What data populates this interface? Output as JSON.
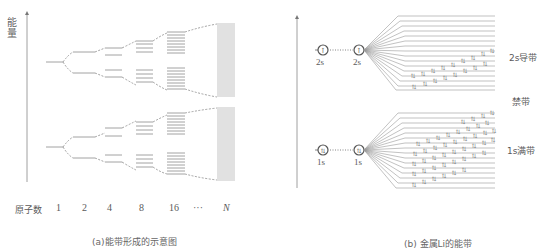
{
  "panel_a": {
    "y_axis_label": "能量",
    "x_axis_title": "原子数",
    "x_ticks": [
      "1",
      "2",
      "4",
      "8",
      "16",
      "···",
      "N"
    ],
    "caption": "(a)能带形成的示意图",
    "levels_per_stage": [
      1,
      2,
      4,
      8,
      16,
      "N"
    ],
    "trees": 2
  },
  "panel_b": {
    "upper_atom_label_left": "2s",
    "upper_atom_label_right": "2s",
    "lower_atom_label_left": "1s",
    "lower_atom_label_right": "1s",
    "upper_atom_symbol": "↑",
    "lower_atom_symbol": "⇅",
    "band_labels": {
      "conduction": "2s导带",
      "gap": "禁带",
      "valence": "1s满带"
    },
    "caption": "(b) 金属Li的能带",
    "upper_band_lines": 16,
    "lower_band_lines": 16
  },
  "colors": {
    "line": "#8a8a8a",
    "text": "#555555",
    "band_fill": "#9a9a9a"
  }
}
